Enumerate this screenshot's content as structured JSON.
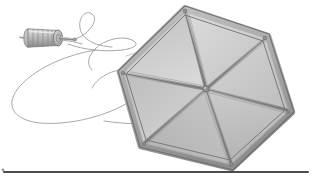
{
  "figure": {
    "title": "Hexagonal kite with string winder",
    "caption": "",
    "medium": "grayscale pencil and wash illustration",
    "background_color": "#ffffff",
    "width": 312,
    "height": 181
  },
  "palette": {
    "paper": "#ffffff",
    "panel_light": "#d2d2d2",
    "panel_mid": "#c3c3c3",
    "panel_dark": "#b4b4b4",
    "panel_darkest": "#a8a8a8",
    "spar_light": "#b9b9b9",
    "spar_mid": "#9a9a9a",
    "spar_dark": "#7e7e7e",
    "outline": "#6e6e6e",
    "outline_soft": "#8c8c8c",
    "string": "#9b9b9b",
    "rule_black": "#111111",
    "spool_light": "#cfcfcf",
    "spool_mid": "#aeaeae",
    "spool_dark": "#8b8b8b"
  },
  "kite": {
    "name": "hexagonal-kite",
    "shape": "hexagon",
    "spoke_count": 6,
    "sail_panel_count": 6,
    "frame_style": "double-rail bordered spars",
    "vertices": [
      {
        "label": "top",
        "x": 185,
        "y": 8
      },
      {
        "label": "top-right",
        "x": 268,
        "y": 36
      },
      {
        "label": "right",
        "x": 292,
        "y": 112
      },
      {
        "label": "bottom",
        "x": 232,
        "y": 168
      },
      {
        "label": "bottom-left",
        "x": 141,
        "y": 146
      },
      {
        "label": "left",
        "x": 120,
        "y": 72
      }
    ],
    "hub": {
      "label": "center-hub",
      "x": 206,
      "y": 89
    },
    "panel_shades": [
      "#cdcdcd",
      "#c6c6c6",
      "#bdbdbd",
      "#b6b6b6",
      "#c9c9c9",
      "#d0d0d0"
    ]
  },
  "winder": {
    "name": "string-winder-spool",
    "center": {
      "x": 44,
      "y": 37
    },
    "body_length": 34,
    "body_height": 17,
    "rib_count": 6,
    "has_handle": true,
    "handle_direction": "right"
  },
  "string": {
    "name": "kite-string",
    "color": "#9b9b9b",
    "stroke_width": 0.9,
    "loop_count": 2,
    "description": "slack line looping in two large ellipses between winder and kite"
  },
  "baseline_rule": {
    "name": "baseline-rule",
    "y": 172,
    "x_start": 4,
    "x_end": 308,
    "thickness": 1.6,
    "color": "#111111"
  }
}
